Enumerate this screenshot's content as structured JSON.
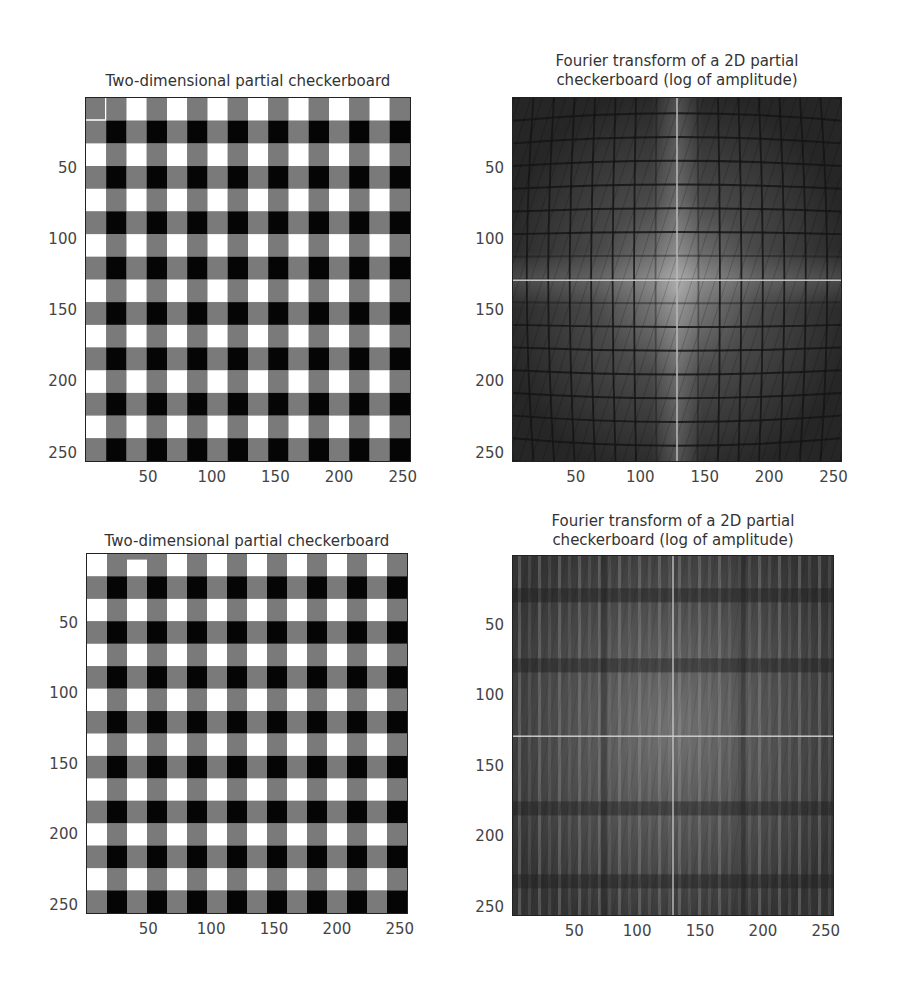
{
  "panels": [
    {
      "id": "top-left",
      "title": "Two-dimensional partial checkerboard",
      "kind": "checkerboard",
      "variant": "a"
    },
    {
      "id": "top-right",
      "title": "Fourier transform of a 2D partial\ncheckerboard (log of amplitude)",
      "kind": "fft",
      "variant": "a"
    },
    {
      "id": "bottom-left",
      "title": "Two-dimensional partial checkerboard",
      "kind": "checkerboard",
      "variant": "b"
    },
    {
      "id": "bottom-right",
      "title": "Fourier transform of a 2D partial\ncheckerboard (log of amplitude)",
      "kind": "fft",
      "variant": "b"
    }
  ],
  "axes": {
    "yticks": [
      "50",
      "100",
      "150",
      "200",
      "250"
    ],
    "xticks": [
      "50",
      "100",
      "150",
      "200",
      "250"
    ]
  },
  "chart_data": [
    {
      "type": "heatmap",
      "title": "Two-dimensional partial checkerboard",
      "xlabel": "",
      "ylabel": "",
      "xlim": [
        1,
        256
      ],
      "ylim": [
        256,
        1
      ],
      "xticks": [
        50,
        100,
        150,
        200,
        250
      ],
      "yticks": [
        50,
        100,
        150,
        200,
        250
      ],
      "colormap": "gray",
      "description": "Grid of alternating white, gray and black squares (period ~32 px); gray vertical and horizontal stripes cross; top-left cell is a gray square outlined in white",
      "levels": {
        "white": "#ffffff",
        "gray": "#7a7a7a",
        "black": "#000000"
      }
    },
    {
      "type": "heatmap",
      "title": "Fourier transform of a 2D partial checkerboard (log of amplitude)",
      "xlabel": "",
      "ylabel": "",
      "xlim": [
        1,
        256
      ],
      "ylim": [
        256,
        1
      ],
      "xticks": [
        50,
        100,
        150,
        200,
        250
      ],
      "yticks": [
        50,
        100,
        150,
        200,
        250
      ],
      "colormap": "gray",
      "description": "Dark log-amplitude spectrum with a grid of dark nodal lines, brighter center near (128,128), thin bright vertical line at x≈128 and horizontal line at y≈128"
    },
    {
      "type": "heatmap",
      "title": "Two-dimensional partial checkerboard",
      "xlabel": "",
      "ylabel": "",
      "xlim": [
        1,
        256
      ],
      "ylim": [
        256,
        1
      ],
      "xticks": [
        50,
        100,
        150,
        200,
        250
      ],
      "yticks": [
        50,
        100,
        150,
        200,
        250
      ],
      "colormap": "gray",
      "description": "Same checkerboard pattern but first row starts with white squares; top row of left portion has gray band",
      "levels": {
        "white": "#ffffff",
        "gray": "#7a7a7a",
        "black": "#000000"
      }
    },
    {
      "type": "heatmap",
      "title": "Fourier transform of a 2D partial checkerboard (log of amplitude)",
      "xlabel": "",
      "ylabel": "",
      "xlim": [
        1,
        256
      ],
      "ylim": [
        256,
        1
      ],
      "xticks": [
        50,
        100,
        150,
        200,
        250
      ],
      "yticks": [
        50,
        100,
        150,
        200,
        250
      ],
      "colormap": "gray",
      "description": "Spectrum dominated by vertical bright stripes, bright horizontal line at y≈128, bright vertical line at x≈128, dark horizontal bands near y≈30, 80, 180, 230"
    }
  ]
}
